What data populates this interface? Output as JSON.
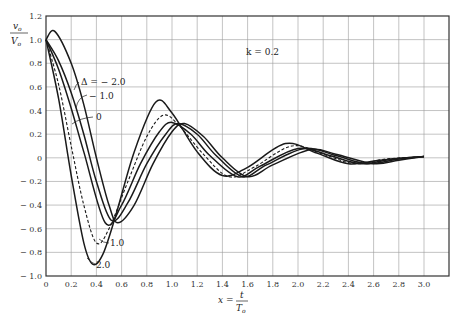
{
  "chart_data": {
    "type": "line",
    "title": "",
    "xlabel": "x = t / T_o",
    "ylabel": "v_o / V_o",
    "xlim": [
      0,
      3.2
    ],
    "ylim": [
      -1.0,
      1.2
    ],
    "grid": true,
    "x_ticks": [
      0,
      0.2,
      0.4,
      0.6,
      0.8,
      1.0,
      1.2,
      1.4,
      1.6,
      1.8,
      2.0,
      2.2,
      2.4,
      2.6,
      2.8,
      3.0
    ],
    "y_ticks": [
      1.2,
      1.0,
      0.8,
      0.6,
      0.4,
      0.2,
      0,
      -0.2,
      -0.4,
      -0.6,
      -0.8,
      -1.0
    ],
    "x_tick_labels": [
      "0",
      "0.2",
      "0.4",
      "0.6",
      "0.8",
      "1.0",
      "1.2",
      "1.4",
      "1.6",
      "1.8",
      "2.0",
      "2.2",
      "2.4",
      "2.6",
      "2.8",
      "3.0"
    ],
    "y_tick_labels": [
      "1.2",
      "1.0",
      "0.8",
      "0.6",
      "0.4",
      "0.2",
      "0",
      "− 0.2",
      "− 0.4",
      "− 0.6",
      "− 0.8",
      "− 1.0"
    ],
    "annotation": "k = 0.2",
    "series": [
      {
        "name": "Δ = −2.0",
        "style": "solid",
        "x": [
          0,
          0.07,
          0.2,
          0.3,
          0.4,
          0.5,
          0.57,
          0.7,
          0.85,
          1.0,
          1.1,
          1.25,
          1.4,
          1.6,
          1.8,
          2.1,
          2.3,
          2.6,
          2.8,
          3.0
        ],
        "values": [
          1.0,
          1.07,
          0.8,
          0.45,
          0.0,
          -0.4,
          -0.55,
          -0.4,
          -0.05,
          0.22,
          0.29,
          0.18,
          0.0,
          -0.16,
          -0.06,
          0.07,
          0.03,
          -0.05,
          -0.02,
          0.01
        ]
      },
      {
        "name": "−1.0",
        "style": "solid",
        "x": [
          0,
          0.1,
          0.2,
          0.3,
          0.4,
          0.52,
          0.65,
          0.8,
          0.95,
          1.05,
          1.2,
          1.35,
          1.56,
          1.75,
          2.05,
          2.3,
          2.55,
          2.8,
          3.0
        ],
        "values": [
          1.0,
          0.82,
          0.55,
          0.2,
          -0.2,
          -0.53,
          -0.38,
          -0.05,
          0.2,
          0.29,
          0.2,
          0.02,
          -0.16,
          -0.06,
          0.08,
          0.02,
          -0.05,
          -0.01,
          0.01
        ]
      },
      {
        "name": "0",
        "style": "solid",
        "x": [
          0,
          0.1,
          0.2,
          0.3,
          0.47,
          0.6,
          0.75,
          0.9,
          1.0,
          1.15,
          1.3,
          1.52,
          1.7,
          2.0,
          2.25,
          2.5,
          2.75,
          3.0
        ],
        "values": [
          1.0,
          0.75,
          0.42,
          0.05,
          -0.55,
          -0.4,
          -0.05,
          0.22,
          0.3,
          0.2,
          0.02,
          -0.16,
          -0.07,
          0.08,
          0.02,
          -0.05,
          -0.01,
          0.01
        ]
      },
      {
        "name": "1.0",
        "style": "dashed",
        "x": [
          0,
          0.1,
          0.2,
          0.3,
          0.4,
          0.5,
          0.65,
          0.8,
          0.93,
          1.05,
          1.25,
          1.45,
          1.65,
          1.95,
          2.2,
          2.45,
          2.7,
          3.0
        ],
        "values": [
          1.0,
          0.62,
          0.1,
          -0.4,
          -0.72,
          -0.6,
          -0.2,
          0.18,
          0.36,
          0.28,
          0.03,
          -0.16,
          -0.08,
          0.1,
          0.03,
          -0.05,
          -0.01,
          0.01
        ]
      },
      {
        "name": "2.0",
        "style": "solid",
        "x": [
          0,
          0.1,
          0.2,
          0.3,
          0.37,
          0.45,
          0.55,
          0.7,
          0.87,
          1.0,
          1.2,
          1.4,
          1.6,
          1.9,
          2.15,
          2.4,
          2.65,
          3.0
        ],
        "values": [
          1.0,
          0.5,
          -0.15,
          -0.72,
          -0.9,
          -0.82,
          -0.5,
          0.05,
          0.47,
          0.38,
          0.05,
          -0.15,
          -0.08,
          0.12,
          0.04,
          -0.05,
          -0.02,
          0.01
        ]
      }
    ]
  },
  "labels": {
    "y_num": "v",
    "y_num_sub": "o",
    "y_den": "V",
    "y_den_sub": "o",
    "x_eq": "x =",
    "x_num": "t",
    "x_den": "T",
    "x_den_sub": "o",
    "k_label": "k = 0.2",
    "delta_m2": "Δ = − 2.0",
    "delta_m1": "− 1.0",
    "delta_0": "0",
    "delta_1": "1.0",
    "delta_2": "2.0"
  },
  "colors": {
    "grid": "#9a9a9a",
    "axis": "#333333",
    "curve": "#1a1a1a"
  }
}
